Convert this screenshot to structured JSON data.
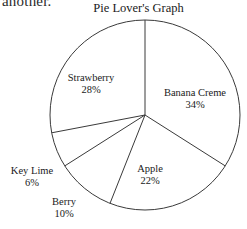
{
  "page_fragment": "another.",
  "chart_data": {
    "type": "pie",
    "title": "Pie Lover's Graph",
    "xlabel": "",
    "ylabel": "",
    "legend_position": "none",
    "grid": false,
    "start_angle_deg": 90,
    "direction": "clockwise",
    "categories": [
      "Banana Creme",
      "Apple",
      "Berry",
      "Key Lime",
      "Strawberry"
    ],
    "values": [
      34,
      22,
      10,
      6,
      28
    ],
    "value_unit": "%",
    "slices": [
      {
        "label": "Banana Creme",
        "value": 34,
        "value_text": "34%",
        "angle_deg": 122.4,
        "color": "#ffffff",
        "stroke": "#3a3a3a"
      },
      {
        "label": "Apple",
        "value": 22,
        "value_text": "22%",
        "angle_deg": 79.2,
        "color": "#ffffff",
        "stroke": "#3a3a3a"
      },
      {
        "label": "Berry",
        "value": 10,
        "value_text": "10%",
        "angle_deg": 36.0,
        "color": "#ffffff",
        "stroke": "#3a3a3a"
      },
      {
        "label": "Key Lime",
        "value": 6,
        "value_text": "6%",
        "angle_deg": 21.6,
        "color": "#ffffff",
        "stroke": "#3a3a3a"
      },
      {
        "label": "Strawberry",
        "value": 28,
        "value_text": "28%",
        "angle_deg": 100.8,
        "color": "#ffffff",
        "stroke": "#3a3a3a"
      }
    ],
    "total": 100,
    "colors": {
      "slice_fill": "#ffffff",
      "outline": "#3a3a3a",
      "text": "#1a1a1a",
      "background": "#ffffff"
    }
  }
}
